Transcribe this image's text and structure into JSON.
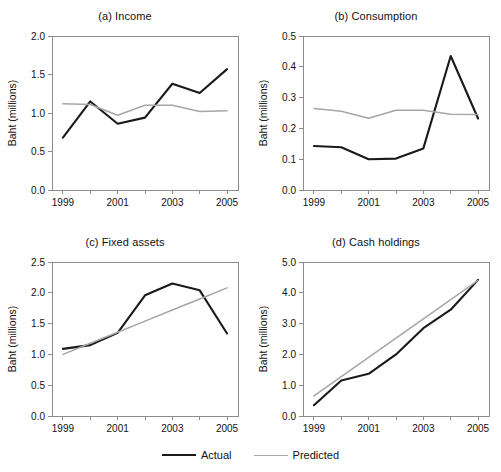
{
  "figure": {
    "xlabel": "",
    "ylabel": "Baht (millions)",
    "x_tick_labels": [
      "1999",
      "2001",
      "2003",
      "2005"
    ],
    "colors": {
      "actual": "#1a1a1a",
      "predicted": "#a6a6a6",
      "axis": "#8c8c8c",
      "background": "#ffffff"
    }
  },
  "legend": {
    "position": "bottom-center",
    "entries": [
      {
        "label": "Actual",
        "icon": "solid-black-line-icon",
        "color": "#1a1a1a"
      },
      {
        "label": "Predicted",
        "icon": "solid-gray-line-icon",
        "color": "#a6a6a6"
      }
    ]
  },
  "chart_data": [
    {
      "type": "line",
      "panel": "a",
      "title": "(a) Income",
      "xlabel": "",
      "ylabel": "Baht (millions)",
      "x": [
        1999,
        2000,
        2001,
        2002,
        2003,
        2004,
        2005
      ],
      "xlim": [
        1998.6,
        2005.4
      ],
      "ylim": [
        0.0,
        2.0
      ],
      "yticks": [
        0.0,
        0.5,
        1.0,
        1.5,
        2.0
      ],
      "ytick_labels": [
        "0.0",
        "0.5",
        "1.0",
        "1.5",
        "2.0"
      ],
      "xticks": [
        1999,
        2000,
        2001,
        2002,
        2003,
        2004,
        2005
      ],
      "xtick_labels": [
        "1999",
        "",
        "2001",
        "",
        "2003",
        "",
        "2005"
      ],
      "grid": false,
      "series": [
        {
          "name": "Actual",
          "values": [
            0.68,
            1.15,
            0.86,
            0.94,
            1.38,
            1.26,
            1.57
          ]
        },
        {
          "name": "Predicted",
          "values": [
            1.12,
            1.11,
            0.97,
            1.1,
            1.1,
            1.02,
            1.03
          ]
        }
      ]
    },
    {
      "type": "line",
      "panel": "b",
      "title": "(b) Consumption",
      "xlabel": "",
      "ylabel": "Baht (millions)",
      "x": [
        1999,
        2000,
        2001,
        2002,
        2003,
        2004,
        2005
      ],
      "xlim": [
        1998.6,
        2005.4
      ],
      "ylim": [
        0.0,
        0.5
      ],
      "yticks": [
        0.0,
        0.1,
        0.2,
        0.3,
        0.4,
        0.5
      ],
      "ytick_labels": [
        "0.0",
        "0.1",
        "0.2",
        "0.3",
        "0.4",
        "0.5"
      ],
      "xticks": [
        1999,
        2000,
        2001,
        2002,
        2003,
        2004,
        2005
      ],
      "xtick_labels": [
        "1999",
        "",
        "2001",
        "",
        "2003",
        "",
        "2005"
      ],
      "grid": false,
      "series": [
        {
          "name": "Actual",
          "values": [
            0.143,
            0.139,
            0.1,
            0.102,
            0.135,
            0.435,
            0.232
          ]
        },
        {
          "name": "Predicted",
          "values": [
            0.265,
            0.256,
            0.233,
            0.259,
            0.259,
            0.246,
            0.245
          ]
        }
      ]
    },
    {
      "type": "line",
      "panel": "c",
      "title": "(c) Fixed assets",
      "xlabel": "",
      "ylabel": "Baht (millions)",
      "x": [
        1999,
        2000,
        2001,
        2002,
        2003,
        2004,
        2005
      ],
      "xlim": [
        1998.6,
        2005.4
      ],
      "ylim": [
        0.0,
        2.5
      ],
      "yticks": [
        0.0,
        0.5,
        1.0,
        1.5,
        2.0,
        2.5
      ],
      "ytick_labels": [
        "0.0",
        "0.5",
        "1.0",
        "1.5",
        "2.0",
        "2.5"
      ],
      "xticks": [
        1999,
        2000,
        2001,
        2002,
        2003,
        2004,
        2005
      ],
      "xtick_labels": [
        "1999",
        "",
        "2001",
        "",
        "2003",
        "",
        "2005"
      ],
      "grid": false,
      "series": [
        {
          "name": "Actual",
          "values": [
            1.09,
            1.15,
            1.35,
            1.96,
            2.15,
            2.04,
            1.34
          ]
        },
        {
          "name": "Predicted",
          "values": [
            1.0,
            1.18,
            1.36,
            1.54,
            1.72,
            1.9,
            2.08
          ]
        }
      ]
    },
    {
      "type": "line",
      "panel": "d",
      "title": "(d) Cash holdings",
      "xlabel": "",
      "ylabel": "Baht (millions)",
      "x": [
        1999,
        2000,
        2001,
        2002,
        2003,
        2004,
        2005
      ],
      "xlim": [
        1998.6,
        2005.4
      ],
      "ylim": [
        0.0,
        5.0
      ],
      "yticks": [
        0.0,
        1.0,
        2.0,
        3.0,
        4.0,
        5.0
      ],
      "ytick_labels": [
        "0.0",
        "1.0",
        "2.0",
        "3.0",
        "4.0",
        "5.0"
      ],
      "xticks": [
        1999,
        2000,
        2001,
        2002,
        2003,
        2004,
        2005
      ],
      "xtick_labels": [
        "1999",
        "",
        "2001",
        "",
        "2003",
        "",
        "2005"
      ],
      "grid": false,
      "series": [
        {
          "name": "Actual",
          "values": [
            0.35,
            1.15,
            1.37,
            2.0,
            2.85,
            3.45,
            4.42
          ]
        },
        {
          "name": "Predicted",
          "values": [
            0.65,
            1.28,
            1.9,
            2.53,
            3.15,
            3.78,
            4.4
          ]
        }
      ]
    }
  ]
}
